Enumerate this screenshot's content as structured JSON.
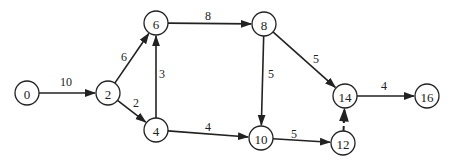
{
  "diagram": {
    "type": "activity-network",
    "colors": {
      "stroke": "#222222",
      "background": "#ffffff"
    },
    "node_radius": 12,
    "nodes": [
      {
        "id": "0",
        "label": "0",
        "x": 27,
        "y": 93
      },
      {
        "id": "2",
        "label": "2",
        "x": 108,
        "y": 93
      },
      {
        "id": "6",
        "label": "6",
        "x": 156,
        "y": 23
      },
      {
        "id": "4",
        "label": "4",
        "x": 156,
        "y": 130
      },
      {
        "id": "8",
        "label": "8",
        "x": 264,
        "y": 24
      },
      {
        "id": "10",
        "label": "10",
        "x": 261,
        "y": 138
      },
      {
        "id": "12",
        "label": "12",
        "x": 343,
        "y": 143
      },
      {
        "id": "14",
        "label": "14",
        "x": 345,
        "y": 96
      },
      {
        "id": "16",
        "label": "16",
        "x": 427,
        "y": 96
      }
    ],
    "edges": [
      {
        "from": "0",
        "to": "2",
        "weight": "10",
        "dashed": false,
        "lx": 66,
        "ly": 82
      },
      {
        "from": "2",
        "to": "6",
        "weight": "6",
        "dashed": false,
        "lx": 124,
        "ly": 57
      },
      {
        "from": "2",
        "to": "4",
        "weight": "2",
        "dashed": false,
        "lx": 136,
        "ly": 103
      },
      {
        "from": "4",
        "to": "6",
        "weight": "3",
        "dashed": false,
        "lx": 162,
        "ly": 74
      },
      {
        "from": "6",
        "to": "8",
        "weight": "8",
        "dashed": false,
        "lx": 208,
        "ly": 16
      },
      {
        "from": "4",
        "to": "10",
        "weight": "4",
        "dashed": false,
        "lx": 208,
        "ly": 127
      },
      {
        "from": "8",
        "to": "10",
        "weight": "5",
        "dashed": false,
        "lx": 271,
        "ly": 74
      },
      {
        "from": "8",
        "to": "14",
        "weight": "5",
        "dashed": false,
        "lx": 316,
        "ly": 59
      },
      {
        "from": "10",
        "to": "12",
        "weight": "5",
        "dashed": false,
        "lx": 294,
        "ly": 134
      },
      {
        "from": "12",
        "to": "14",
        "weight": "",
        "dashed": true,
        "lx": 0,
        "ly": 0
      },
      {
        "from": "14",
        "to": "16",
        "weight": "4",
        "dashed": false,
        "lx": 384,
        "ly": 86
      }
    ]
  }
}
